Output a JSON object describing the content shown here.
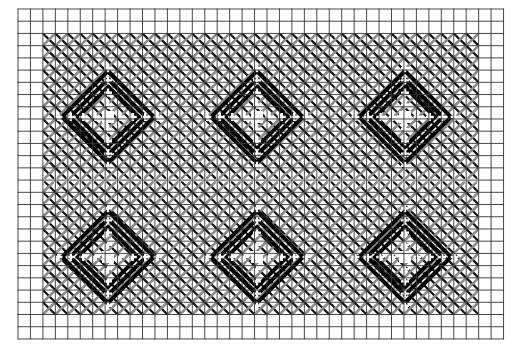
{
  "diagram": {
    "type": "needlework-chart",
    "grid": {
      "x0": 18,
      "y0": 9,
      "cols": 39,
      "rows": 27,
      "cell_w": 12.45,
      "cell_h": 12.22,
      "line_color": "#333333"
    },
    "stitch_area": {
      "col_start": 2,
      "col_end": 37,
      "row_start": 2,
      "row_end": 25
    },
    "colors": {
      "light_stitch": "#8a8a8a",
      "dark_stitch": "#111111",
      "motif": "#000000",
      "background": "#ffffff"
    },
    "band_rows": [
      14
    ],
    "band_cols": [
      13.5,
      25.5
    ],
    "motifs": [
      {
        "cx": 108,
        "cy": 117
      },
      {
        "cx": 257,
        "cy": 117
      },
      {
        "cx": 405,
        "cy": 117
      },
      {
        "cx": 108,
        "cy": 257
      },
      {
        "cx": 257,
        "cy": 257
      },
      {
        "cx": 405,
        "cy": 257
      }
    ],
    "motif_radii": [
      30,
      38,
      46
    ]
  }
}
